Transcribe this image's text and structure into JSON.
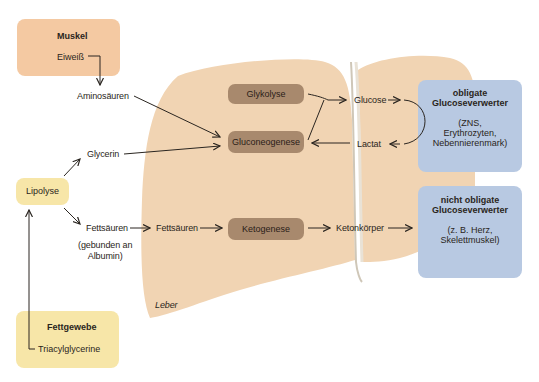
{
  "colors": {
    "muscle_box": "#f4c9a2",
    "liver": "#f1d4b3",
    "process_box": "#a8896d",
    "glucose_box": "#b8c9e2",
    "lipolyse_box": "#f7e6a8",
    "fat_box": "#f7e6a8",
    "arrow": "#2a2520"
  },
  "muscle": {
    "title": "Muskel",
    "item": "Eiweiß"
  },
  "fat_tissue": {
    "title": "Fettgewebe",
    "item": "Triacylglycerine"
  },
  "lipolyse": {
    "label": "Lipolyse"
  },
  "intermediates": {
    "aminosaeuren": "Aminosäuren",
    "glycerin": "Glycerin",
    "fettsaeuren_left": "Fettsäuren",
    "fettsaeuren_liver": "Fettsäuren",
    "albumin_note_line1": "(gebunden an",
    "albumin_note_line2": "Albumin)",
    "glucose": "Glucose",
    "lactat": "Lactat",
    "ketonkoerper": "Ketonkörper"
  },
  "liver": {
    "label": "Leber",
    "processes": {
      "glykolyse": "Glykolyse",
      "gluconeogenese": "Gluconeogenese",
      "ketogenese": "Ketogenese"
    }
  },
  "obligate": {
    "title_line1": "obligate",
    "title_line2": "Glucoseverwerter",
    "detail_line1": "(ZNS,",
    "detail_line2": "Erythrozyten,",
    "detail_line3": "Nebennierenmark)"
  },
  "non_obligate": {
    "title_line1": "nicht obligate",
    "title_line2": "Glucoseverwerter",
    "detail_line1": "(z. B. Herz,",
    "detail_line2": "Skelettmuskel)"
  }
}
